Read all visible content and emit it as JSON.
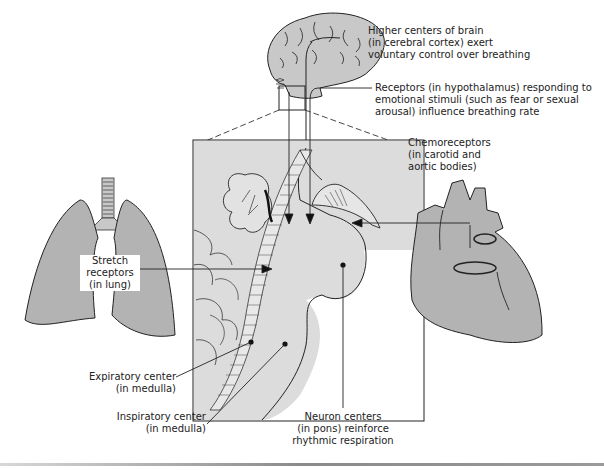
{
  "diagram": {
    "colors": {
      "tissue_fill": "#c8c8c8",
      "inset_fill": "#d9d9d9",
      "organ_fill": "#b3b3b3",
      "stroke": "#222222",
      "background": "#ffffff"
    },
    "labels": {
      "higher_centers": [
        "Higher centers of brain",
        "(in cerebral cortex) exert",
        "voluntary control over breathing"
      ],
      "hypothalamus": [
        "Receptors (in hypothalamus) responding to",
        "emotional stimuli (such as fear or sexual",
        "arousal) influence breathing rate"
      ],
      "chemoreceptors": [
        "Chemoreceptors",
        "(in carotid and",
        "aortic bodies)"
      ],
      "stretch": [
        "Stretch",
        "receptors",
        "(in lung)"
      ],
      "expiratory": [
        "Expiratory center",
        "(in medulla)"
      ],
      "inspiratory": [
        "Inspiratory center",
        "(in medulla)"
      ],
      "neuron_centers": [
        "Neuron centers",
        "(in pons) reinforce",
        "rhythmic respiration"
      ]
    },
    "structures": [
      "brain",
      "brainstem-inset",
      "lungs",
      "heart"
    ]
  }
}
